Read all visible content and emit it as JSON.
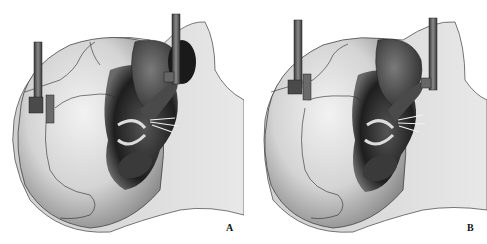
{
  "figure": {
    "panels": [
      {
        "id": "A",
        "label": "A",
        "description": "Skull with surgical retractors, view A"
      },
      {
        "id": "B",
        "label": "B",
        "description": "Skull with surgical retractors, view B"
      }
    ],
    "colors": {
      "background": "#ffffff",
      "skull_light": "#e6e6e6",
      "skull_mid": "#bdbdbd",
      "shadow": "#2a2a2a",
      "instrument": "#5a5a5a",
      "suture_line": "#333333"
    }
  }
}
